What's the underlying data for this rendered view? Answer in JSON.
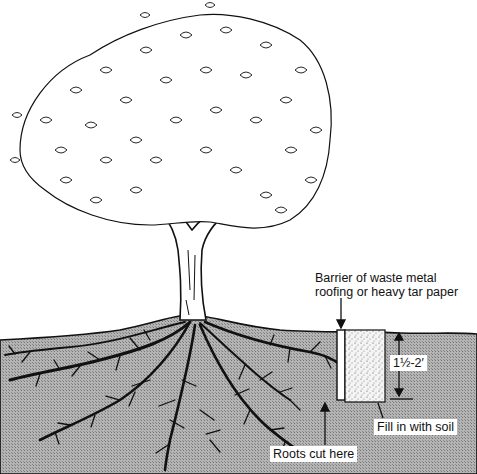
{
  "diagram": {
    "labels": {
      "barrier_line1": "Barrier of waste metal",
      "barrier_line2": "roofing or heavy tar paper",
      "depth": "1½-2′",
      "fill": "Fill in with soil",
      "roots_cut": "Roots cut here"
    },
    "colors": {
      "ink": "#111111",
      "soil": "#a8a8a8",
      "background": "#ffffff",
      "fill_soil": "#f2f2f2"
    }
  }
}
